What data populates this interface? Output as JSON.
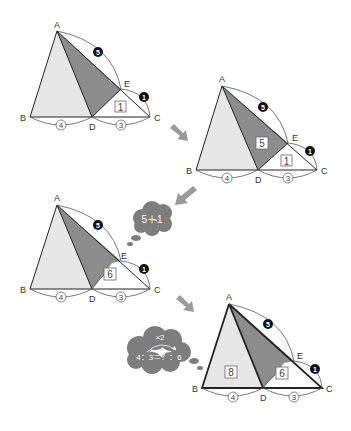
{
  "colors": {
    "light_fill": "#e6e6e6",
    "dark_fill": "#8c8c8c",
    "line": "#222222",
    "arc": "#555555",
    "arrow": "#9a9a9a",
    "cloud": "#7d7d7d",
    "black_circle": "#111111"
  },
  "vertex_labels": {
    "A": "A",
    "B": "B",
    "C": "C",
    "D": "D",
    "E": "E"
  },
  "segment_ratios": {
    "BD": "4",
    "DC": "3",
    "AE": "5",
    "EC": "1"
  },
  "diagrams": [
    {
      "step": 1,
      "area_EDC": "1"
    },
    {
      "step": 2,
      "area_ADE": "5",
      "area_EDC": "1"
    },
    {
      "step": 3,
      "area_ADC": "6",
      "thought": "5＋1"
    },
    {
      "step": 4,
      "area_ABD": "8",
      "area_ADC": "6",
      "thought_top": "×2",
      "thought_main": "4：3＝？：6"
    }
  ],
  "arrows": [
    {
      "from": "diagram-1",
      "to": "diagram-2",
      "direction": "down-right"
    },
    {
      "from": "diagram-2",
      "to": "diagram-3",
      "direction": "down-left"
    },
    {
      "from": "diagram-3",
      "to": "diagram-4",
      "direction": "down-right"
    }
  ]
}
